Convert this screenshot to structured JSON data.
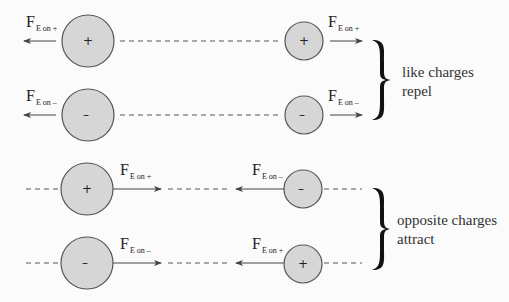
{
  "colors": {
    "background": "#fbfbfb",
    "circle_fill": "#d6d6d6",
    "circle_stroke": "#555555",
    "line": "#444444",
    "text": "#222222"
  },
  "rows": [
    {
      "large": {
        "sign": "+",
        "cx": 88,
        "cy": 41
      },
      "small": {
        "sign": "+",
        "cx": 304,
        "cy": 41
      },
      "label_left": {
        "F": "F",
        "sub": "E on +"
      },
      "label_right": {
        "F": "F",
        "sub": "E on +"
      }
    },
    {
      "large": {
        "sign": "–",
        "cx": 88,
        "cy": 115
      },
      "small": {
        "sign": "–",
        "cx": 304,
        "cy": 115
      },
      "label_left": {
        "F": "F",
        "sub": "E on –"
      },
      "label_right": {
        "F": "F",
        "sub": "E on –"
      }
    },
    {
      "large": {
        "sign": "+",
        "cx": 87,
        "cy": 189
      },
      "small": {
        "sign": "–",
        "cx": 303,
        "cy": 189
      },
      "label_left": {
        "F": "F",
        "sub": "E on +"
      },
      "label_right": {
        "F": "F",
        "sub": "E on –"
      }
    },
    {
      "large": {
        "sign": "–",
        "cx": 87,
        "cy": 263
      },
      "small": {
        "sign": "+",
        "cx": 303,
        "cy": 264
      },
      "label_left": {
        "F": "F",
        "sub": "E on –"
      },
      "label_right": {
        "F": "F",
        "sub": "E on +"
      }
    }
  ],
  "groups": [
    {
      "line1": "like charges",
      "line2": "repel"
    },
    {
      "line1": "opposite charges",
      "line2": "attract"
    }
  ]
}
